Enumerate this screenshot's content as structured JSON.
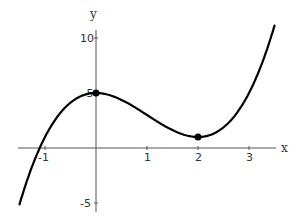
{
  "chart_data": {
    "type": "line",
    "title": "",
    "xlabel": "x",
    "ylabel": "y",
    "function": "x^3 - 3x^2 + 5",
    "xlim": [
      -1.5,
      3.5
    ],
    "ylim": [
      -5.5,
      11
    ],
    "x_ticks": [
      -1,
      1,
      2,
      3
    ],
    "x_tick_labels": [
      "-1",
      "1",
      "2",
      "3"
    ],
    "y_ticks": [
      -5,
      5,
      10
    ],
    "y_tick_labels": [
      "-5",
      "5",
      "10"
    ],
    "grid": false,
    "legend": null,
    "series": [
      {
        "name": "f(x)",
        "x": [
          -1.5,
          -1.25,
          -1.0,
          -0.75,
          -0.5,
          -0.25,
          0,
          0.25,
          0.5,
          0.75,
          1.0,
          1.25,
          1.5,
          1.75,
          2.0,
          2.25,
          2.5,
          2.75,
          3.0,
          3.25,
          3.5
        ],
        "values": [
          -5.1,
          -1.64,
          1.0,
          2.89,
          4.13,
          4.8,
          5.0,
          4.83,
          4.38,
          3.73,
          3.0,
          2.27,
          1.63,
          1.17,
          1.0,
          1.2,
          1.88,
          3.11,
          5.0,
          7.64,
          11.13
        ]
      }
    ],
    "marked_points": [
      {
        "x": 0,
        "y": 5,
        "label": "local max"
      },
      {
        "x": 2,
        "y": 1,
        "label": "local min"
      }
    ]
  },
  "axes": {
    "x_label": "x",
    "y_label": "y"
  }
}
